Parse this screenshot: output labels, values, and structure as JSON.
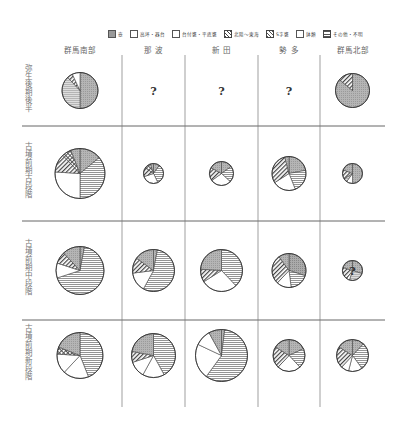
{
  "chart_data": {
    "type": "pie",
    "title": "",
    "legend": [
      {
        "key": "tsubo",
        "label": "壺",
        "pattern": "dots"
      },
      {
        "key": "takatsuki",
        "label": "高坏・器台",
        "pattern": "open-box"
      },
      {
        "key": "kame",
        "label": "台付甕・平底甕",
        "pattern": "empty"
      },
      {
        "key": "s_kame",
        "label": "北陸〜東海",
        "pattern": "diag"
      },
      {
        "key": "kyushu",
        "label": "S字甕",
        "pattern": "cross"
      },
      {
        "key": "bowl",
        "label": "鉢類",
        "pattern": "empty"
      },
      {
        "key": "other",
        "label": "その他・不明",
        "pattern": "hlines"
      }
    ],
    "columns": [
      "群馬南部",
      "那 波",
      "新 田",
      "勢 多",
      "群馬北部"
    ],
    "rows": [
      "弥生後期後半",
      "古墳前期古段階",
      "古墳前期中段階",
      "古墳前期新段階"
    ],
    "cells": [
      [
        {
          "r": 18,
          "slices": [
            [
              "tsubo",
              50
            ],
            [
              "hlines_light",
              38
            ],
            [
              "diag",
              5
            ],
            [
              "empty",
              7
            ]
          ]
        },
        {
          "unknown": true,
          "mark": "?"
        },
        {
          "unknown": true,
          "mark": "?"
        },
        {
          "unknown": true,
          "mark": "?"
        },
        {
          "r": 17,
          "slices": [
            [
              "tsubo",
              86
            ],
            [
              "diag",
              14
            ]
          ]
        }
      ],
      [
        {
          "r": 25,
          "slices": [
            [
              "tsubo",
              14
            ],
            [
              "other",
              36
            ],
            [
              "empty",
              26
            ],
            [
              "diag",
              12
            ],
            [
              "cross",
              6
            ],
            [
              "tsubo2",
              6
            ]
          ]
        },
        {
          "r": 10,
          "slices": [
            [
              "tsubo",
              10
            ],
            [
              "other",
              33
            ],
            [
              "empty",
              27
            ],
            [
              "diag",
              15
            ],
            [
              "cross",
              10
            ],
            [
              "tsubo2",
              5
            ]
          ]
        },
        {
          "r": 12,
          "slices": [
            [
              "tsubo",
              15
            ],
            [
              "other",
              22
            ],
            [
              "empty",
              28
            ],
            [
              "diag",
              18
            ],
            [
              "tsubo2",
              17
            ]
          ]
        },
        {
          "r": 17,
          "slices": [
            [
              "tsubo",
              22
            ],
            [
              "other",
              22
            ],
            [
              "empty",
              22
            ],
            [
              "diag",
              30
            ],
            [
              "tsubo2",
              4
            ]
          ]
        },
        {
          "r": 10,
          "slices": [
            [
              "tsubo",
              50
            ],
            [
              "empty",
              10
            ],
            [
              "hlines_light",
              6
            ],
            [
              "diag",
              15
            ],
            [
              "tsubo2",
              19
            ]
          ]
        }
      ],
      [
        {
          "r": 24,
          "slices": [
            [
              "tsubo2",
              3
            ],
            [
              "other",
              67
            ],
            [
              "empty",
              10
            ],
            [
              "diag",
              8
            ],
            [
              "tsubo",
              12
            ]
          ]
        },
        {
          "r": 21,
          "slices": [
            [
              "tsubo2",
              3
            ],
            [
              "other",
              55
            ],
            [
              "empty",
              15
            ],
            [
              "diag",
              12
            ],
            [
              "tsubo",
              15
            ]
          ]
        },
        {
          "r": 21,
          "slices": [
            [
              "tsubo",
              0
            ],
            [
              "other",
              38
            ],
            [
              "empty",
              28
            ],
            [
              "diag",
              10
            ],
            [
              "tsubo2",
              24
            ]
          ]
        },
        {
          "r": 17,
          "slices": [
            [
              "dots",
              30
            ],
            [
              "other",
              18
            ],
            [
              "empty",
              14
            ],
            [
              "diag",
              28
            ],
            [
              "tsubo2",
              10
            ]
          ]
        },
        {
          "r": 10,
          "slices": [
            [
              "tsubo",
              30
            ],
            [
              "hlines_light",
              25
            ],
            [
              "empty",
              5
            ],
            [
              "diag",
              20
            ],
            [
              "tsubo2",
              20
            ]
          ],
          "mark": "?"
        }
      ],
      [
        {
          "r": 23,
          "slices": [
            [
              "other",
              44
            ],
            [
              "empty",
              18
            ],
            [
              "empty2",
              14
            ],
            [
              "cross",
              5
            ],
            [
              "tsubo",
              19
            ]
          ]
        },
        {
          "r": 22,
          "slices": [
            [
              "other",
              42
            ],
            [
              "empty",
              16
            ],
            [
              "empty2",
              12
            ],
            [
              "diag",
              8
            ],
            [
              "tsubo",
              22
            ]
          ]
        },
        {
          "r": 26,
          "slices": [
            [
              "tsubo2",
              2
            ],
            [
              "other",
              58
            ],
            [
              "empty",
              22
            ],
            [
              "empty2",
              10
            ],
            [
              "tsubo",
              8
            ]
          ]
        },
        {
          "r": 16,
          "slices": [
            [
              "tsubo",
              18
            ],
            [
              "other",
              20
            ],
            [
              "empty",
              24
            ],
            [
              "diag",
              22
            ],
            [
              "tsubo2",
              16
            ]
          ]
        },
        {
          "r": 16,
          "slices": [
            [
              "tsubo",
              12
            ],
            [
              "other",
              28
            ],
            [
              "empty",
              14
            ],
            [
              "empty2",
              8
            ],
            [
              "diag",
              22
            ],
            [
              "tsubo2",
              16
            ]
          ]
        }
      ]
    ],
    "grid": {
      "x_lines": [
        122,
        185,
        258,
        320
      ],
      "y_lines": [
        126,
        221,
        320
      ],
      "left": 22,
      "right": 385,
      "top": 55,
      "bottom": 407
    }
  }
}
